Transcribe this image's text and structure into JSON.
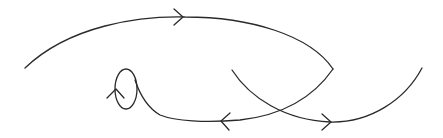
{
  "diagram": {
    "type": "directed-curve-diagram",
    "stroke_color": "#2a2a2a",
    "background": "#ffffff",
    "elements": [
      {
        "id": "upper-arc",
        "description": "Large arc from left end up over the top to a cusp on the right",
        "arrow": "right",
        "arrow_position": [
          180,
          17
        ]
      },
      {
        "id": "lower-return-curve",
        "description": "Curve from cusp down-left past crossing to bottom, then into small loop",
        "arrow": "left",
        "arrow_position": [
          224,
          121
        ]
      },
      {
        "id": "small-loop",
        "description": "Small elliptical loop on left-center",
        "arrow": "up",
        "arrow_position": [
          117,
          96
        ]
      },
      {
        "id": "right-arc",
        "description": "Arc descending from center, crossing lower curve, bottoming out and rising to the right",
        "arrow": "right",
        "arrow_position": [
          330,
          121
        ]
      }
    ],
    "crossings": [
      {
        "position": [
          280,
          112
        ]
      }
    ]
  }
}
